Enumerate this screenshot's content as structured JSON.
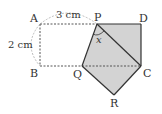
{
  "labels": {
    "A": "A",
    "B": "B",
    "C": "C",
    "D": "D",
    "P": "P",
    "Q": "Q",
    "R": "R"
  },
  "measurements": {
    "top": "3 cm",
    "left": "2 cm"
  },
  "angle_label": "x",
  "colors": {
    "fill": "#d3d3d3",
    "stroke": "#333333",
    "dashed": "#555555",
    "arc": "#aaaaaa"
  }
}
